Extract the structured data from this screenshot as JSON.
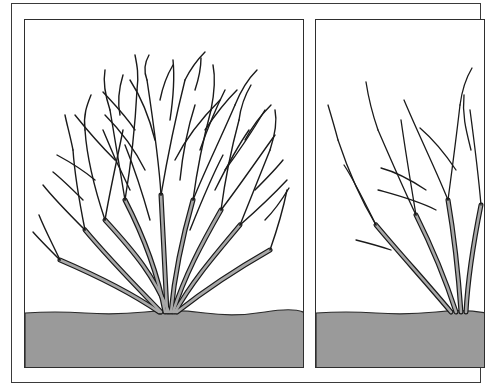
{
  "illustration": {
    "title": "",
    "colors": {
      "background": "#ffffff",
      "frame": "#3a3a3a",
      "ground": "#9a9a9a",
      "stem_fill": "#a8a8a8",
      "branch_line": "#1a1a1a"
    },
    "panels": [
      {
        "id": "left",
        "description": "dense overgrown shrub before pruning",
        "ground_y": 293
      },
      {
        "id": "right",
        "description": "thinned shrub after pruning (cropped at right edge)",
        "ground_y": 293
      }
    ]
  }
}
